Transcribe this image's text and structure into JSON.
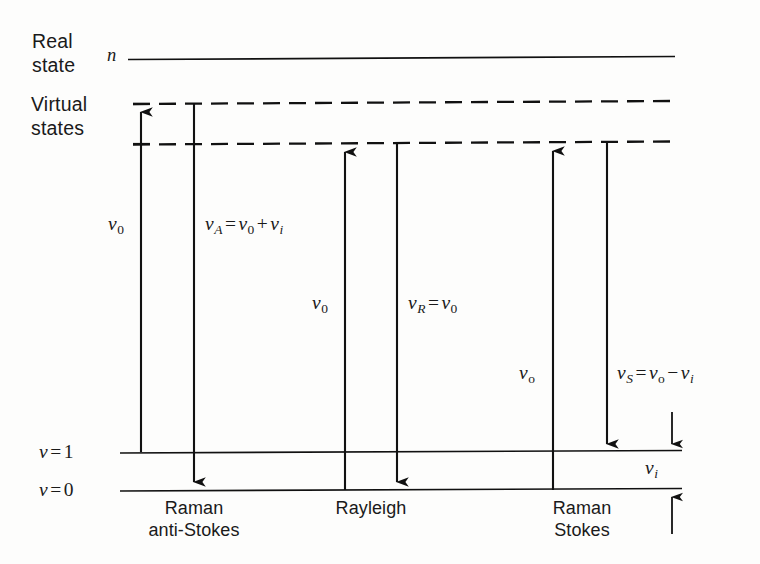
{
  "figure": {
    "background_color": "#fdfdfc",
    "line_color": "#111111"
  },
  "levels": {
    "real_state": {
      "label_line1": "Real",
      "label_line2": "state",
      "level_symbol": "n",
      "y": 58,
      "style": "solid"
    },
    "virtual_states": {
      "label_line1": "Virtual",
      "label_line2": "states",
      "upper_y": 103,
      "lower_y": 143,
      "style": "dashed"
    },
    "vibrational": [
      {
        "label": "v = 1",
        "symbol": "v",
        "value": "1",
        "y": 452,
        "style": "solid"
      },
      {
        "label": "v = 0",
        "symbol": "v",
        "value": "0",
        "y": 490,
        "style": "solid"
      }
    ]
  },
  "processes": [
    {
      "name": "raman-anti-stokes",
      "caption_line1": "Raman",
      "caption_line2": "anti-Stokes",
      "caption_center_x": 194,
      "excitation": {
        "label_plain": "ν0",
        "nu": "ν",
        "sub": "0",
        "x": 141,
        "from_y": 452,
        "to_y": 103,
        "direction": "up",
        "label_x": 108,
        "label_y": 212
      },
      "emission": {
        "label_plain": "νA = ν0 + νi",
        "terms": [
          {
            "nu": "ν",
            "sub": "A",
            "sub_italic": true
          },
          {
            "op": "="
          },
          {
            "nu": "ν",
            "sub": "0",
            "sub_italic": false
          },
          {
            "op": "+"
          },
          {
            "nu": "ν",
            "sub": "i",
            "sub_italic": true
          }
        ],
        "x": 194,
        "from_y": 103,
        "to_y": 490,
        "direction": "down",
        "label_x": 205,
        "label_y": 212
      }
    },
    {
      "name": "rayleigh",
      "caption_line1": "Rayleigh",
      "caption_line2": "",
      "caption_center_x": 371,
      "excitation": {
        "label_plain": "ν0",
        "nu": "ν",
        "sub": "0",
        "x": 345,
        "from_y": 490,
        "to_y": 143,
        "direction": "up",
        "label_x": 312,
        "label_y": 290
      },
      "emission": {
        "label_plain": "νR = ν0",
        "terms": [
          {
            "nu": "ν",
            "sub": "R",
            "sub_italic": true
          },
          {
            "op": "="
          },
          {
            "nu": "ν",
            "sub": "0",
            "sub_italic": false
          }
        ],
        "x": 397,
        "from_y": 143,
        "to_y": 490,
        "direction": "down",
        "label_x": 408,
        "label_y": 290
      }
    },
    {
      "name": "raman-stokes",
      "caption_line1": "Raman",
      "caption_line2": "Stokes",
      "caption_center_x": 582,
      "excitation": {
        "label_plain": "νo",
        "nu": "ν",
        "sub": "o",
        "x": 553,
        "from_y": 490,
        "to_y": 143,
        "direction": "up",
        "label_x": 519,
        "label_y": 360
      },
      "emission": {
        "label_plain": "νS = νo − νi",
        "terms": [
          {
            "nu": "ν",
            "sub": "S",
            "sub_italic": true
          },
          {
            "op": "="
          },
          {
            "nu": "ν",
            "sub": "o",
            "sub_italic": false
          },
          {
            "op": "−"
          },
          {
            "nu": "ν",
            "sub": "i",
            "sub_italic": true
          }
        ],
        "x": 607,
        "from_y": 143,
        "to_y": 452,
        "direction": "down",
        "label_x": 617,
        "label_y": 360
      }
    }
  ],
  "vibrational_gap": {
    "name": "vibrational-quantum",
    "label_plain": "νi",
    "nu": "ν",
    "sub": "i",
    "x": 672,
    "label_x": 648,
    "label_y": 456,
    "top_arrow_from_y": 412,
    "top_arrow_to_y": 452,
    "bottom_arrow_from_y": 534,
    "bottom_arrow_to_y": 490
  },
  "geometry": {
    "left_line_x": 120,
    "right_line_x": 682,
    "real_line_x_start": 128,
    "real_line_x_end": 675,
    "virtual_line_x_start": 133,
    "virtual_line_x_end": 672,
    "dash_pattern": "16 9"
  }
}
